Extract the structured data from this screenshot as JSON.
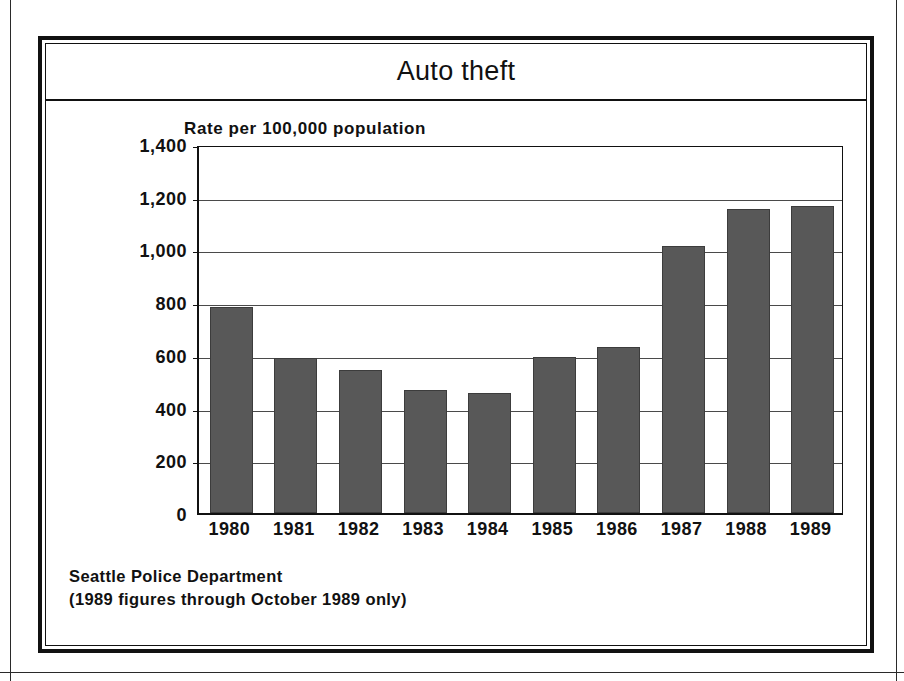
{
  "chart_title": "Auto theft",
  "axis_note": "Rate per 100,000 population",
  "source": {
    "line1": "Seattle Police Department",
    "line2": "(1989 figures through October 1989 only)"
  },
  "colors": {
    "bar_fill": "#585858",
    "bar_stroke": "#3c3c3c",
    "frame": "#111111",
    "gridline": "#4a4a4a",
    "background": "#ffffff"
  },
  "chart_data": {
    "type": "bar",
    "title": "Auto theft",
    "subtitle": "Rate per 100,000 population",
    "xlabel": "",
    "ylabel": "Rate per 100,000 population",
    "categories": [
      "1980",
      "1981",
      "1982",
      "1983",
      "1984",
      "1985",
      "1986",
      "1987",
      "1988",
      "1989"
    ],
    "values": [
      780,
      588,
      543,
      466,
      455,
      592,
      628,
      1012,
      1152,
      1165
    ],
    "ylim": [
      0,
      1400
    ],
    "yticks": [
      0,
      200,
      400,
      600,
      800,
      1000,
      1200,
      1400
    ],
    "ytick_labels": [
      "0",
      "200",
      "400",
      "600",
      "800",
      "1,000",
      "1,200",
      "1,400"
    ],
    "grid": true,
    "legend": false,
    "annotations": [
      "Seattle Police Department",
      "(1989 figures through October 1989 only)"
    ]
  }
}
